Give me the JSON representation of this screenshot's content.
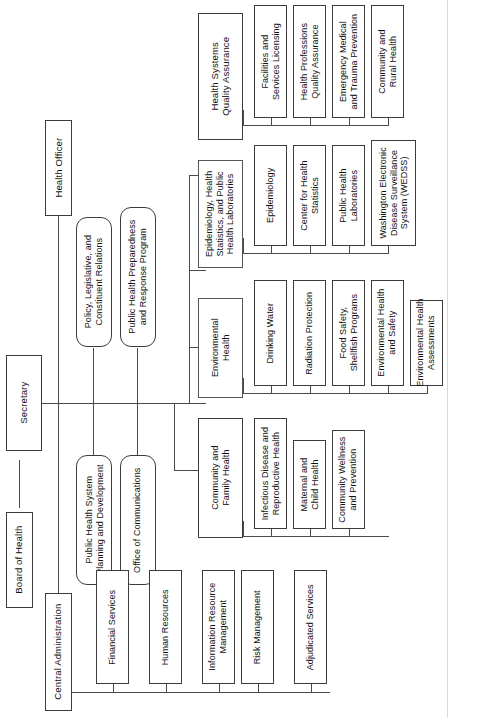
{
  "chart_title": "Washington State Department of Health Organizational Chart",
  "colors": {
    "box_border": "#3c3c3c",
    "box_fill": "#ffffff",
    "line": "#4a4a4a",
    "text": "#111111",
    "page_background": "#ffffff"
  },
  "orientation": "rotated-90-ccw",
  "nodes": {
    "board_of_health": "Board of Health",
    "secretary": "Secretary",
    "health_officer": "Health Officer",
    "policy_legislative": "Policy, Legislative, and\nConstituent Relations",
    "public_health_preparedness": "Public Health Preparedness\nand Response Program",
    "public_health_system_planning": "Public Health System\nPlanning and Development",
    "office_of_communications": "Office of Communications",
    "central_administration": "Central Administration",
    "health_systems_quality_assurance": "Health Systems\nQuality Assurance",
    "epidemiology_group": "Epidemiology, Health\nStatistics, and Public\nHealth Laboratories",
    "environmental_health": "Environmental\nHealth",
    "community_and_family_health": "Community and\nFamily Health"
  },
  "branches": [
    {
      "parent": "Health Systems Quality Assurance",
      "children": [
        "Facilities and\nServices Licensing",
        "Health Professions\nQuality Assurance",
        "Emergency Medical\nand Trauma Prevention",
        "Community and\nRural Health"
      ]
    },
    {
      "parent": "Epidemiology, Health Statistics, and Public Health Laboratories",
      "children": [
        "Epidemiology",
        "Center for Health\nStatistics",
        "Public Health\nLaboratories",
        "Washington Electronic\nDisease Surveillance\nSystem (WEDSS)"
      ]
    },
    {
      "parent": "Environmental Health",
      "children": [
        "Drinking Water",
        "Radiation Protection",
        "Food Safety,\nShellfish Programs",
        "Environmental Health\nand Safety",
        "Environmental Health\nAssessments"
      ]
    },
    {
      "parent": "Community and Family Health",
      "children": [
        "Infectious Disease and\nReproductive Health",
        "Maternal and\nChild Health",
        "Community Wellness\nand Prevention"
      ]
    },
    {
      "parent": "Central Administration",
      "children": [
        "Financial Services",
        "Human Resources",
        "Information Resource\nManagement",
        "Risk Management",
        "Adjudicated Services"
      ]
    }
  ],
  "staff_units": [
    "Policy, Legislative, and\nConstituent Relations",
    "Public Health Preparedness\nand Response Program",
    "Public Health System\nPlanning and Development",
    "Office of Communications"
  ],
  "labels": {
    "hsqa_child_1": "Facilities and\nServices Licensing",
    "hsqa_child_2": "Health Professions\nQuality Assurance",
    "hsqa_child_3": "Emergency Medical\nand Trauma Prevention",
    "hsqa_child_4": "Community and\nRural Health",
    "epi_child_1": "Epidemiology",
    "epi_child_2": "Center for Health\nStatistics",
    "epi_child_3": "Public Health\nLaboratories",
    "epi_child_4": "Washington Electronic\nDisease Surveillance\nSystem (WEDSS)",
    "eh_child_1": "Drinking Water",
    "eh_child_2": "Radiation Protection",
    "eh_child_3": "Food Safety,\nShellfish Programs",
    "eh_child_4": "Environmental Health\nand Safety",
    "eh_child_5": "Environmental Health\nAssessments",
    "cfh_child_1": "Infectious Disease and\nReproductive Health",
    "cfh_child_2": "Maternal and\nChild Health",
    "cfh_child_3": "Community Wellness\nand Prevention",
    "ca_child_1": "Financial Services",
    "ca_child_2": "Human Resources",
    "ca_child_3": "Information Resource\nManagement",
    "ca_child_4": "Risk Management",
    "ca_child_5": "Adjudicated Services"
  }
}
